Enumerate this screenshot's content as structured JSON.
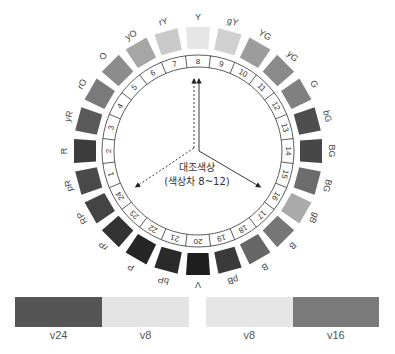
{
  "diagram": {
    "center_label_line1": "대조색상",
    "center_label_line2": "(색상차 8~12)",
    "hues": [
      {
        "number": "1",
        "label": "pR",
        "gray": "#4a4a4a"
      },
      {
        "number": "2",
        "label": "R",
        "gray": "#3c3c3c"
      },
      {
        "number": "3",
        "label": "yR",
        "gray": "#5a5a5a"
      },
      {
        "number": "4",
        "label": "rO",
        "gray": "#7a7a7a"
      },
      {
        "number": "5",
        "label": "O",
        "gray": "#8c8c8c"
      },
      {
        "number": "6",
        "label": "yO",
        "gray": "#a6a6a6"
      },
      {
        "number": "7",
        "label": "rY",
        "gray": "#cacaca"
      },
      {
        "number": "8",
        "label": "Y",
        "gray": "#e6e6e6"
      },
      {
        "number": "9",
        "label": "gY",
        "gray": "#d0d0d0"
      },
      {
        "number": "10",
        "label": "YG",
        "gray": "#9c9c9c"
      },
      {
        "number": "11",
        "label": "yG",
        "gray": "#8a8a8a"
      },
      {
        "number": "12",
        "label": "G",
        "gray": "#808080"
      },
      {
        "number": "13",
        "label": "bG",
        "gray": "#4e4e4e"
      },
      {
        "number": "14",
        "label": "BG",
        "gray": "#474747"
      },
      {
        "number": "15",
        "label": "BG",
        "gray": "#6c6c6c"
      },
      {
        "number": "16",
        "label": "gB",
        "gray": "#aaaaaa"
      },
      {
        "number": "17",
        "label": "B",
        "gray": "#767676"
      },
      {
        "number": "18",
        "label": "B",
        "gray": "#666666"
      },
      {
        "number": "19",
        "label": "pB",
        "gray": "#3a3a3a"
      },
      {
        "number": "20",
        "label": "V",
        "gray": "#1e1e1e"
      },
      {
        "number": "21",
        "label": "bP",
        "gray": "#2a2a2a"
      },
      {
        "number": "22",
        "label": "P",
        "gray": "#262626"
      },
      {
        "number": "23",
        "label": "rP",
        "gray": "#333333"
      },
      {
        "number": "24",
        "label": "RP",
        "gray": "#444444"
      }
    ],
    "arrows": [
      {
        "from_hue": 0,
        "to_hue": 8,
        "style": "solid"
      },
      {
        "from_hue": 0,
        "to_hue": 16,
        "style": "solid"
      },
      {
        "from_hue": 0,
        "to_hue": 8,
        "style": "dashed"
      },
      {
        "from_hue": 0,
        "to_hue": 24,
        "style": "dashed"
      }
    ]
  },
  "comparisons": {
    "left": [
      {
        "label": "v24",
        "color": "#555555"
      },
      {
        "label": "v8",
        "color": "#e4e4e4"
      }
    ],
    "right": [
      {
        "label": "v8",
        "color": "#e6e6e6"
      },
      {
        "label": "v16",
        "color": "#7a7a7a"
      }
    ]
  }
}
